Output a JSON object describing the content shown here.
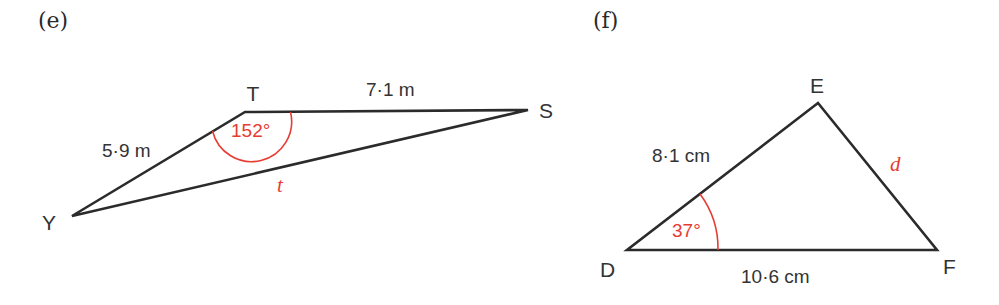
{
  "colors": {
    "line": "#2b2b2b",
    "accent": "#e63c32",
    "text": "#333333"
  },
  "figures": [
    {
      "part_label": "(e)",
      "vertices": {
        "top": "T",
        "right": "S",
        "left": "Y"
      },
      "sides": {
        "TS": "7·1 m",
        "TY": "5·9 m",
        "YS": "t"
      },
      "angle": {
        "at": "T",
        "label": "152°"
      }
    },
    {
      "part_label": "(f)",
      "vertices": {
        "top": "E",
        "left": "D",
        "right": "F"
      },
      "sides": {
        "DE": "8·1 cm",
        "DF": "10·6 cm",
        "EF": "d"
      },
      "angle": {
        "at": "D",
        "label": "37°"
      }
    }
  ]
}
